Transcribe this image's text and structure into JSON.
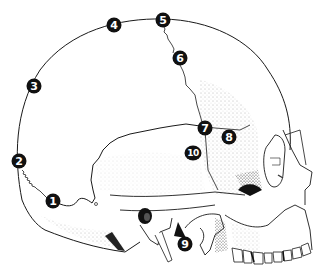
{
  "figure": {
    "line_color": "#1a1a1a",
    "stipple_color": "#444444",
    "markers": [
      {
        "label": "1",
        "x": 53,
        "y": 201
      },
      {
        "label": "2",
        "x": 19,
        "y": 161
      },
      {
        "label": "3",
        "x": 34,
        "y": 86
      },
      {
        "label": "4",
        "x": 114,
        "y": 25
      },
      {
        "label": "5",
        "x": 163,
        "y": 20
      },
      {
        "label": "6",
        "x": 180,
        "y": 58
      },
      {
        "label": "7",
        "x": 205,
        "y": 128
      },
      {
        "label": "8",
        "x": 229,
        "y": 137
      },
      {
        "label": "9",
        "x": 185,
        "y": 244
      },
      {
        "label": "10",
        "x": 193,
        "y": 153
      }
    ]
  }
}
